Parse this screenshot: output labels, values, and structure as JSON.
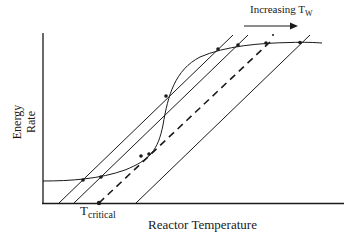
{
  "diagram": {
    "x_axis_label": "Reactor Temperature",
    "y_axis_label_line1": "Energy",
    "y_axis_label_line2": "Rate",
    "critical_label_main": "T",
    "critical_label_sub": "critical",
    "arrow_label_main": "Increasing T",
    "arrow_label_sub": "W",
    "colors": {
      "line": "#1a1a1a",
      "background": "#ffffff"
    },
    "elements": {
      "heat_generation_curve": "S-shaped curve (heat generation rate)",
      "heat_removal_lines": 4,
      "critical_line_style": "dashed",
      "intersection_points": 8
    }
  }
}
